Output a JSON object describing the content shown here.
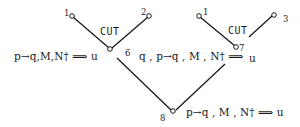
{
  "diagram": {
    "type": "proof-tree",
    "subtrees": [
      {
        "name": "left-cut",
        "rule_label": "CUT",
        "premise_nodes": [
          {
            "id": "1",
            "label": "1"
          },
          {
            "id": "2",
            "label": "2"
          }
        ],
        "conclusion_node": {
          "id": "6",
          "label": "6"
        }
      },
      {
        "name": "right-cut",
        "rule_label": "CUT",
        "premise_nodes": [
          {
            "id": "1",
            "label": "1"
          },
          {
            "id": "3",
            "label": "3"
          }
        ],
        "conclusion_node": {
          "id": "7",
          "label": "7"
        }
      }
    ],
    "root_node": {
      "id": "8",
      "label": "8"
    },
    "sequents": {
      "node6_left": "p→q,M,N† ⟹ u",
      "node7_left": "q , p→q , M , N† ⟹",
      "node7_right": "u",
      "node8": "p→q , M , N† ⟹ u"
    },
    "line_color": "#1a1a1a",
    "background": "#ffffff"
  }
}
